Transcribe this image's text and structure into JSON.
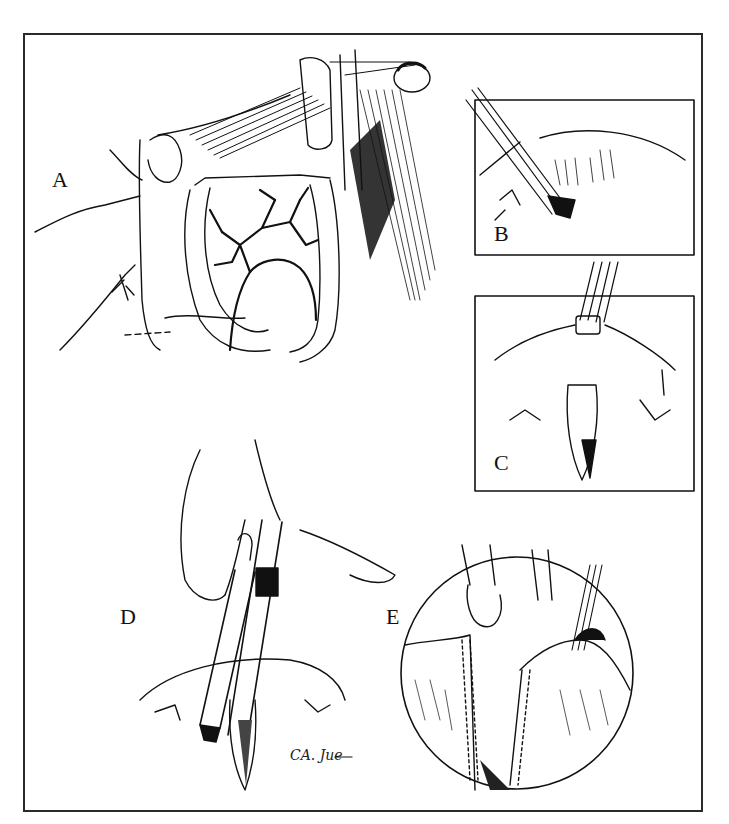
{
  "figure": {
    "type": "multi-panel surgical line illustration",
    "border_color": "#2a2a2a",
    "ink_color": "#111111",
    "background": "#ffffff"
  },
  "panels": [
    {
      "id": "A",
      "label": "A",
      "subject": "exposed bowel loop with mesenteric vascular arcade, retracted by hand and retractor"
    },
    {
      "id": "B",
      "label": "B",
      "subject": "inset: clamp/instrument dividing tissue at bowel wall"
    },
    {
      "id": "C",
      "label": "C",
      "subject": "inset: bowel segment pulled up through ring with forceps"
    },
    {
      "id": "D",
      "label": "D",
      "subject": "hands inserting linear stapling device into bowel"
    },
    {
      "id": "E",
      "label": "E",
      "subject": "circular magnified view: two stapled bowel edges held by clamps"
    }
  ],
  "signature": {
    "text": "CA. Jue"
  }
}
